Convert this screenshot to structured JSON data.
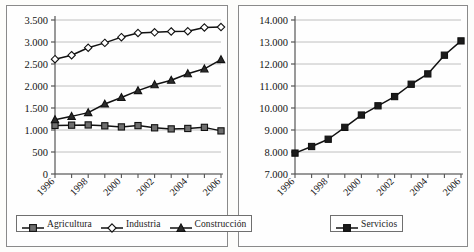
{
  "figure": {
    "background": "#fdfdfb",
    "line_color": "#111111",
    "grid_color": "#b9b9b9",
    "axis_color": "#555555"
  },
  "panels": [
    {
      "id": "left",
      "name": "sectors-panel",
      "legend": [
        {
          "label": "Agricultura",
          "marker": "square",
          "fill": "#6f6f6f"
        },
        {
          "label": "Industria",
          "marker": "diamond",
          "fill": "#ffffff"
        },
        {
          "label": "Construcción",
          "marker": "triangle",
          "fill": "#2b2b2b"
        }
      ]
    },
    {
      "id": "right",
      "name": "services-panel",
      "legend": [
        {
          "label": "Servicios",
          "marker": "square",
          "fill": "#1b1b1b"
        }
      ]
    }
  ],
  "chart_data": [
    {
      "type": "line",
      "title": "",
      "xlabel": "",
      "ylabel": "",
      "x": [
        1996,
        1997,
        1998,
        1999,
        2000,
        2001,
        2002,
        2003,
        2004,
        2005,
        2006
      ],
      "categories": [
        "1996",
        "1997",
        "1998",
        "1999",
        "2000",
        "2001",
        "2002",
        "2003",
        "2004",
        "2005",
        "2006"
      ],
      "tick_labels_shown": [
        "1996",
        "1998",
        "2000",
        "2002",
        "2004",
        "2006"
      ],
      "ylim": [
        0,
        3500
      ],
      "yticks": [
        0,
        500,
        1000,
        1500,
        2000,
        2500,
        3000,
        3500
      ],
      "ytick_labels": [
        "0",
        "500",
        "1.000",
        "1.500",
        "2.000",
        "2.500",
        "3.000",
        "3.500"
      ],
      "grid": true,
      "legend_position": "bottom",
      "series": [
        {
          "name": "Agricultura",
          "marker": "square",
          "values": [
            1105,
            1110,
            1115,
            1095,
            1070,
            1100,
            1050,
            1025,
            1035,
            1060,
            980
          ]
        },
        {
          "name": "Industria",
          "marker": "diamond",
          "values": [
            2610,
            2700,
            2870,
            2980,
            3110,
            3205,
            3220,
            3240,
            3245,
            3330,
            3340
          ]
        },
        {
          "name": "Construcción",
          "marker": "triangle",
          "values": [
            1235,
            1310,
            1395,
            1590,
            1740,
            1895,
            2030,
            2130,
            2280,
            2390,
            2600
          ]
        }
      ]
    },
    {
      "type": "line",
      "title": "",
      "xlabel": "",
      "ylabel": "",
      "x": [
        1996,
        1997,
        1998,
        1999,
        2000,
        2001,
        2002,
        2003,
        2004,
        2005,
        2006
      ],
      "categories": [
        "1996",
        "1997",
        "1998",
        "1999",
        "2000",
        "2001",
        "2002",
        "2003",
        "2004",
        "2005",
        "2006"
      ],
      "tick_labels_shown": [
        "1996",
        "1998",
        "2000",
        "2002",
        "2004",
        "2006"
      ],
      "ylim": [
        7000,
        14000
      ],
      "yticks": [
        7000,
        8000,
        9000,
        10000,
        11000,
        12000,
        13000,
        14000
      ],
      "ytick_labels": [
        "7.000",
        "8.000",
        "9.000",
        "10.000",
        "11.000",
        "12.000",
        "13.000",
        "14.000"
      ],
      "grid": true,
      "legend_position": "bottom",
      "series": [
        {
          "name": "Servicios",
          "marker": "square",
          "values": [
            7950,
            8250,
            8580,
            9120,
            9680,
            10100,
            10520,
            11080,
            11550,
            12400,
            13050
          ]
        }
      ]
    }
  ]
}
